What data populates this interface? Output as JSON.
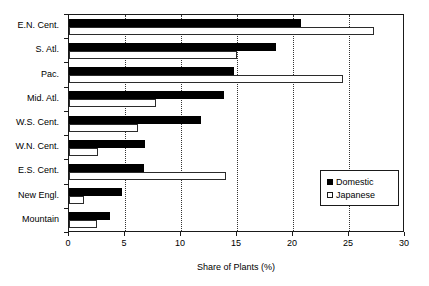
{
  "chart_data": {
    "type": "bar",
    "orientation": "horizontal",
    "title": "",
    "xlabel": "Share of Plants (%)",
    "ylabel": "",
    "xlim": [
      0,
      30
    ],
    "xticks": [
      0,
      5,
      10,
      15,
      20,
      25,
      30
    ],
    "xtick_labels": [
      "0",
      "5",
      "10",
      "15",
      "20",
      "25",
      "30"
    ],
    "grid": "vertical-dotted",
    "legend_position": "middle-right",
    "categories": [
      "E.N. Cent.",
      "S. Atl.",
      "Pac.",
      "Mid. Atl.",
      "W.S. Cent.",
      "W.N. Cent.",
      "E.S. Cent.",
      "New Engl.",
      "Mountain"
    ],
    "series": [
      {
        "name": "Domestic",
        "color": "#000000",
        "values": [
          20.7,
          18.5,
          14.7,
          13.8,
          11.8,
          6.8,
          6.7,
          4.7,
          3.7
        ]
      },
      {
        "name": "Japanese",
        "color": "#ffffff",
        "values": [
          27.2,
          15.0,
          24.5,
          7.8,
          6.2,
          2.6,
          14.0,
          1.3,
          2.5
        ]
      }
    ]
  },
  "legend": {
    "entries": [
      {
        "label": "Domestic",
        "swatch": "filled-black-square"
      },
      {
        "label": "Japanese",
        "swatch": "open-white-square"
      }
    ]
  },
  "colors": {
    "domestic": "#000000",
    "japanese": "#ffffff",
    "axis": "#1a1a1a",
    "grid": "#333333",
    "background": "#ffffff"
  }
}
